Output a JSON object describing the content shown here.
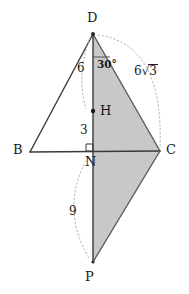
{
  "figure": {
    "type": "geometry-diagram",
    "background_color": "#ffffff",
    "stroke_color": "#3a3a3a",
    "fill_color": "#c8c8c8",
    "dashed_color": "#b0b0b0",
    "points": {
      "D": {
        "label": "D",
        "x": 93,
        "y": 34,
        "label_x": 87,
        "label_y": 11
      },
      "B": {
        "label": "B",
        "x": 30,
        "y": 152,
        "label_x": 14,
        "label_y": 144
      },
      "C": {
        "label": "C",
        "x": 160,
        "y": 151,
        "label_x": 166,
        "label_y": 143
      },
      "N": {
        "label": "N",
        "x": 93,
        "y": 151,
        "label_x": 85,
        "label_y": 156
      },
      "H": {
        "label": "H",
        "x": 93,
        "y": 111,
        "label_x": 100,
        "label_y": 104
      },
      "P": {
        "label": "P",
        "x": 93,
        "y": 262,
        "label_x": 85,
        "label_y": 270
      }
    },
    "measures": [
      {
        "name": "segment-DH",
        "text": "6",
        "x": 77,
        "y": 62
      },
      {
        "name": "segment-HN",
        "text": "3",
        "x": 80,
        "y": 124
      },
      {
        "name": "segment-NP",
        "text": "9",
        "x": 69,
        "y": 205
      },
      {
        "name": "angle-at-D",
        "text": "30°",
        "x": 97,
        "y": 59
      }
    ],
    "radical_label": {
      "name": "segment-DC",
      "coefficient": "6",
      "radicand": "3",
      "x": 134,
      "y": 64
    },
    "shaded_region": {
      "name": "triangle-DCP",
      "vertices": [
        "D",
        "C",
        "P"
      ]
    },
    "segments": [
      {
        "name": "edge-BD",
        "from": "B",
        "to": "D"
      },
      {
        "name": "edge-BC",
        "from": "B",
        "to": "C"
      },
      {
        "name": "edge-DC",
        "from": "D",
        "to": "C"
      },
      {
        "name": "edge-DP",
        "from": "D",
        "to": "P"
      },
      {
        "name": "edge-CP",
        "from": "C",
        "to": "P"
      }
    ],
    "right_angle_marker": {
      "name": "right-angle-at-N",
      "x": 86,
      "y": 144,
      "size": 7
    },
    "angle_tick": {
      "name": "angle-tick-at-D",
      "x1": 93,
      "y1": 57,
      "x2": 110,
      "y2": 57
    },
    "arcs": [
      {
        "name": "arc-DH",
        "d": "M 90 38 Q 76 74 86 109"
      },
      {
        "name": "arc-DC",
        "d": "M 98 35 Q 162 46 160 147"
      },
      {
        "name": "arc-NP",
        "d": "M 88 156 Q 60 208 89 259"
      }
    ]
  }
}
